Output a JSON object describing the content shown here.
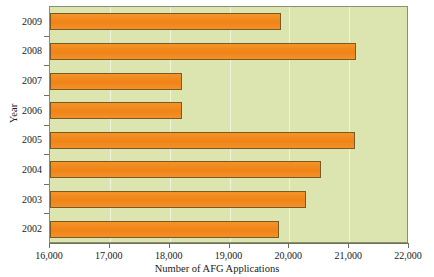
{
  "chart_data": {
    "type": "bar",
    "orientation": "horizontal",
    "title": "",
    "xlabel": "Number of AFG Applications",
    "ylabel": "Year",
    "categories": [
      "2009",
      "2008",
      "2007",
      "2006",
      "2005",
      "2004",
      "2003",
      "2002"
    ],
    "values": [
      19860,
      21120,
      18200,
      18200,
      21100,
      20530,
      20280,
      19830
    ],
    "xlim": [
      16000,
      22000
    ],
    "xticks": [
      16000,
      17000,
      18000,
      19000,
      20000,
      21000,
      22000
    ],
    "xtick_labels": [
      "16,000",
      "17,000",
      "18,000",
      "19,000",
      "20,000",
      "21,000",
      "22,000"
    ],
    "grid": true,
    "legend": false,
    "bar_color": "#f18a20",
    "bar_edge_color": "#7a5a24",
    "plot_background": "#dce5b0"
  },
  "axes": {
    "x_title": "Number of AFG Applications",
    "y_title": "Year"
  }
}
